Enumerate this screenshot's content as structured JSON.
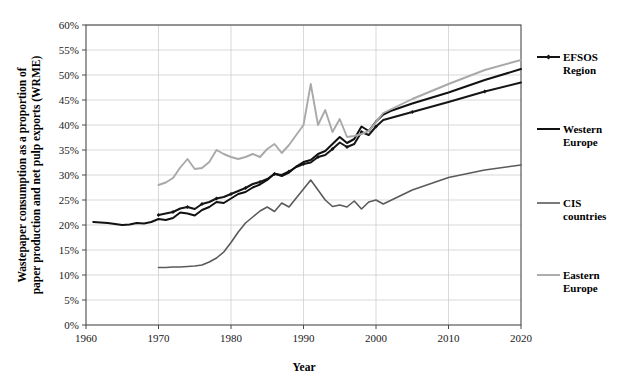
{
  "chart_data": {
    "type": "line",
    "title": "",
    "xlabel": "Year",
    "ylabel": "Wastepaper consumption as a proportion of paper production and net pulp exports (WRME)",
    "xlim": [
      1960,
      2020
    ],
    "ylim": [
      0,
      60
    ],
    "grid": true,
    "legend_position": "right",
    "x_ticks": [
      "1960",
      "1970",
      "1980",
      "1990",
      "2000",
      "2010",
      "2020"
    ],
    "y_ticks": [
      "0%",
      "5%",
      "10%",
      "15%",
      "20%",
      "25%",
      "30%",
      "35%",
      "40%",
      "45%",
      "50%",
      "55%",
      "60%"
    ],
    "y_tick_values": [
      0,
      5,
      10,
      15,
      20,
      25,
      30,
      35,
      40,
      45,
      50,
      55,
      60
    ],
    "x_tick_values": [
      1960,
      1970,
      1980,
      1990,
      2000,
      2010,
      2020
    ],
    "series": [
      {
        "name": "EFSOS Region",
        "color": "#151515",
        "width": 2.0,
        "marker": "diamond",
        "x": [
          1970,
          1971,
          1972,
          1973,
          1974,
          1975,
          1976,
          1977,
          1978,
          1979,
          1980,
          1981,
          1982,
          1983,
          1984,
          1985,
          1986,
          1987,
          1988,
          1989,
          1990,
          1991,
          1992,
          1993,
          1994,
          1995,
          1996,
          1997,
          1998,
          1999,
          2000,
          2001,
          2005,
          2010,
          2015,
          2020
        ],
        "values": [
          22.0,
          22.3,
          22.6,
          23.3,
          23.6,
          23.2,
          24.2,
          24.6,
          25.3,
          25.6,
          26.2,
          26.8,
          27.4,
          28.2,
          28.6,
          29.2,
          30.2,
          30.0,
          30.7,
          31.6,
          32.2,
          32.5,
          33.6,
          34.0,
          35.2,
          36.5,
          35.6,
          36.2,
          38.6,
          38.0,
          39.7,
          41.0,
          42.6,
          44.6,
          46.7,
          48.5
        ]
      },
      {
        "name": "Western Europe",
        "color": "#111111",
        "width": 2.0,
        "marker": "none",
        "x": [
          1961,
          1962,
          1963,
          1964,
          1965,
          1966,
          1967,
          1968,
          1969,
          1970,
          1971,
          1972,
          1973,
          1974,
          1975,
          1976,
          1977,
          1978,
          1979,
          1980,
          1981,
          1982,
          1983,
          1984,
          1985,
          1986,
          1987,
          1988,
          1989,
          1990,
          1991,
          1992,
          1993,
          1994,
          1995,
          1996,
          1997,
          1998,
          1999,
          2000,
          2001,
          2002,
          2005,
          2010,
          2015,
          2020
        ],
        "values": [
          20.6,
          20.5,
          20.4,
          20.2,
          20.0,
          20.1,
          20.4,
          20.3,
          20.6,
          21.2,
          21.0,
          21.4,
          22.5,
          22.3,
          21.9,
          23.0,
          23.6,
          24.6,
          24.4,
          25.3,
          26.2,
          26.6,
          27.5,
          28.1,
          29.0,
          30.3,
          29.8,
          30.5,
          31.7,
          32.6,
          33.0,
          34.2,
          34.8,
          36.2,
          37.6,
          36.4,
          37.2,
          39.7,
          38.8,
          40.7,
          42.1,
          42.8,
          44.3,
          46.5,
          49.0,
          51.2
        ]
      },
      {
        "name": "CIS countries",
        "color": "#5a5a5a",
        "width": 1.6,
        "marker": "none",
        "x": [
          1970,
          1971,
          1972,
          1973,
          1974,
          1975,
          1976,
          1977,
          1978,
          1979,
          1980,
          1981,
          1982,
          1983,
          1984,
          1985,
          1986,
          1987,
          1988,
          1989,
          1990,
          1991,
          1992,
          1993,
          1994,
          1995,
          1996,
          1997,
          1998,
          1999,
          2000,
          2001,
          2005,
          2010,
          2015,
          2020
        ],
        "values": [
          11.5,
          11.5,
          11.6,
          11.6,
          11.7,
          11.8,
          12.0,
          12.6,
          13.4,
          14.6,
          16.5,
          18.6,
          20.4,
          21.6,
          22.8,
          23.6,
          22.7,
          24.4,
          23.6,
          25.4,
          27.2,
          29.0,
          27.0,
          25.0,
          23.7,
          24.0,
          23.6,
          24.8,
          23.2,
          24.6,
          25.0,
          24.2,
          27.0,
          29.5,
          31.0,
          32.0
        ]
      },
      {
        "name": "Eastern Europe",
        "color": "#a9a9a9",
        "width": 1.9,
        "marker": "none",
        "x": [
          1970,
          1971,
          1972,
          1973,
          1974,
          1975,
          1976,
          1977,
          1978,
          1979,
          1980,
          1981,
          1982,
          1983,
          1984,
          1985,
          1986,
          1987,
          1988,
          1989,
          1990,
          1991,
          1992,
          1993,
          1994,
          1995,
          1996,
          1997,
          1998,
          1999,
          2000,
          2001,
          2005,
          2010,
          2015,
          2020
        ],
        "values": [
          28.0,
          28.5,
          29.4,
          31.5,
          33.2,
          31.2,
          31.4,
          32.6,
          35.0,
          34.2,
          33.6,
          33.2,
          33.6,
          34.2,
          33.6,
          35.2,
          36.2,
          34.4,
          36.0,
          38.0,
          40.0,
          48.2,
          40.0,
          43.0,
          38.6,
          41.2,
          37.6,
          37.8,
          38.2,
          38.8,
          40.6,
          42.4,
          45.2,
          48.2,
          51.0,
          53.0
        ]
      }
    ]
  },
  "legend": {
    "items": [
      {
        "label_line1": "EFSOS",
        "label_line2": "Region"
      },
      {
        "label_line1": "Western",
        "label_line2": "Europe"
      },
      {
        "label_line1": "CIS",
        "label_line2": "countries"
      },
      {
        "label_line1": "Eastern",
        "label_line2": "Europe"
      }
    ]
  }
}
